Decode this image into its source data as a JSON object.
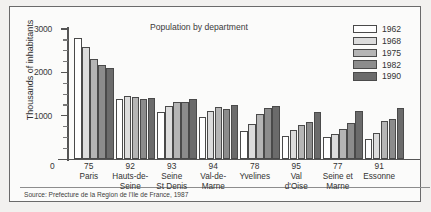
{
  "chart_data": {
    "type": "bar",
    "title": "Population by department",
    "xlabel": "",
    "ylabel": "Thousands of inhabitants",
    "ylim": [
      0,
      3000
    ],
    "yticks": [
      0,
      1000,
      2000,
      3000
    ],
    "ytick_labels": [
      "0",
      "1000",
      "2000",
      "3000"
    ],
    "minor_ticks": [
      250,
      500,
      750,
      1250,
      1500,
      1750,
      2250,
      2500,
      2750
    ],
    "grid": false,
    "legend_position": "top-right",
    "categories": [
      {
        "code": "75",
        "name": "Paris",
        "name_lines": [
          "Paris"
        ]
      },
      {
        "code": "92",
        "name": "Hauts-de-Seine",
        "name_lines": [
          "Hauts-de-",
          "Seine"
        ]
      },
      {
        "code": "93",
        "name": "Seine St Denis",
        "name_lines": [
          "Seine",
          "St Denis"
        ]
      },
      {
        "code": "94",
        "name": "Val-de-Marne",
        "name_lines": [
          "Val-de-",
          "Marne"
        ]
      },
      {
        "code": "78",
        "name": "Yvelines",
        "name_lines": [
          "Yvelines"
        ]
      },
      {
        "code": "95",
        "name": "Val d'Oise",
        "name_lines": [
          "Val",
          "d'Oise"
        ]
      },
      {
        "code": "77",
        "name": "Seine et Marne",
        "name_lines": [
          "Seine et",
          "Marne"
        ]
      },
      {
        "code": "91",
        "name": "Essonne",
        "name_lines": [
          "Essonne"
        ]
      }
    ],
    "series": [
      {
        "name": "1962",
        "color": "#ffffff",
        "values": [
          2790,
          1395,
          1075,
          960,
          640,
          530,
          500,
          465
        ]
      },
      {
        "name": "1968",
        "color": "#dcdcdc",
        "values": [
          2590,
          1455,
          1230,
          1100,
          810,
          675,
          570,
          605
        ]
      },
      {
        "name": "1975",
        "color": "#b5b5b5",
        "values": [
          2300,
          1435,
          1320,
          1200,
          1050,
          790,
          700,
          880
        ]
      },
      {
        "name": "1982",
        "color": "#8c8c8c",
        "values": [
          2180,
          1380,
          1305,
          1145,
          1180,
          855,
          820,
          920
        ]
      },
      {
        "name": "1990",
        "color": "#6b6b6b",
        "values": [
          2110,
          1405,
          1385,
          1250,
          1230,
          1080,
          1110,
          1180
        ]
      }
    ],
    "source": "Source: Prefecture de la Region de l'Ile de France, 1987"
  }
}
